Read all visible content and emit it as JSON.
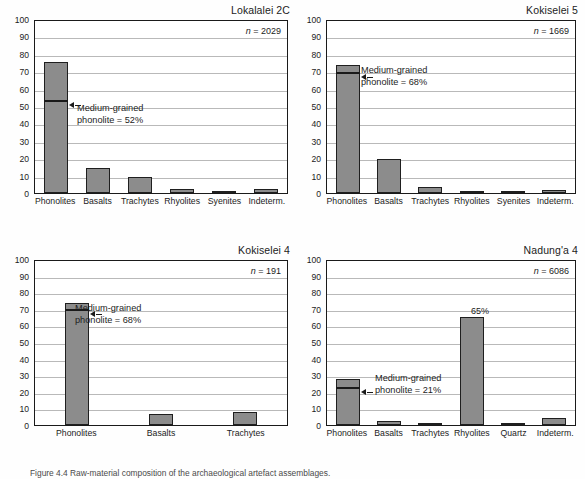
{
  "figure": {
    "caption": "Figure 4.4  Raw-material composition of the archaeological artefact assemblages.",
    "bar_color": "#8c8c8c",
    "bar_outline": "#1f1f1f",
    "grid_color": "#b9b9b9",
    "axis_color": "#1a1a1a"
  },
  "chart_data": [
    {
      "type": "bar",
      "title": "Lokalalei 2C",
      "n_label": "n = 2029",
      "n_value": 2029,
      "categories": [
        "Phonolites",
        "Basalts",
        "Trachytes",
        "Rhyolites",
        "Syenites",
        "Indeterm."
      ],
      "values": [
        75.5,
        14.5,
        9,
        2.5,
        0,
        2.5
      ],
      "subdivision": {
        "label_line1": "Medium-grained",
        "label_line2": "phonolite = 52%",
        "category": "Phonolites",
        "value": 52
      },
      "ylim": [
        0,
        100
      ],
      "yticks": [
        100,
        90,
        80,
        70,
        60,
        50,
        40,
        30,
        20,
        10,
        0
      ],
      "xlabel": "",
      "ylabel": "",
      "grid": true
    },
    {
      "type": "bar",
      "title": "Kokiselei 5",
      "n_label": "n = 1669",
      "n_value": 1669,
      "categories": [
        "Phonolites",
        "Basalts",
        "Trachytes",
        "Rhyolites",
        "Syenites",
        "Indeterm."
      ],
      "values": [
        73.5,
        19.5,
        3.5,
        1.3,
        1.3,
        2
      ],
      "subdivision": {
        "label_line1": "Medium-grained",
        "label_line2": "phonolite = 68%",
        "category": "Phonolites",
        "value": 68
      },
      "ylim": [
        0,
        100
      ],
      "yticks": [
        100,
        90,
        80,
        70,
        60,
        50,
        40,
        30,
        20,
        10,
        0
      ],
      "xlabel": "",
      "ylabel": "",
      "grid": true
    },
    {
      "type": "bar",
      "title": "Kokiselei 4",
      "n_label": "n = 191",
      "n_value": 191,
      "categories": [
        "Phonolites",
        "Basalts",
        "Trachytes"
      ],
      "values": [
        73.5,
        6.5,
        8
      ],
      "subdivision": {
        "label_line1": "Medium-grained",
        "label_line2": "phonolite = 68%",
        "category": "Phonolites",
        "value": 68
      },
      "ylim": [
        0,
        100
      ],
      "yticks": [
        100,
        90,
        80,
        70,
        60,
        50,
        40,
        30,
        20,
        10,
        0
      ],
      "xlabel": "",
      "ylabel": "",
      "grid": true
    },
    {
      "type": "bar",
      "title": "Nadung'a 4",
      "n_label": "n = 6086",
      "n_value": 6086,
      "categories": [
        "Phonolites",
        "Basalts",
        "Trachytes",
        "Rhyolites",
        "Quartz",
        "Indeterm."
      ],
      "values": [
        27.5,
        2.5,
        0.4,
        65,
        0.6,
        4.2
      ],
      "data_labels": [
        null,
        null,
        null,
        "65%",
        null,
        null
      ],
      "subdivision": {
        "label_line1": "Medium-grained",
        "label_line2": "phonolite = 21%",
        "category": "Phonolites",
        "value": 21
      },
      "ylim": [
        0,
        100
      ],
      "yticks": [
        100,
        90,
        80,
        70,
        60,
        50,
        40,
        30,
        20,
        10,
        0
      ],
      "xlabel": "",
      "ylabel": "",
      "grid": true
    }
  ]
}
